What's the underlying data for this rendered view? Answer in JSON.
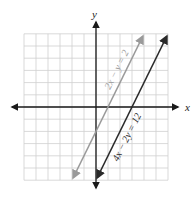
{
  "chart_data": {
    "type": "line",
    "title": "",
    "xlabel": "x",
    "ylabel": "y",
    "xlim": [
      -6,
      6
    ],
    "ylim": [
      -6,
      6
    ],
    "grid": true,
    "grid_step": 1,
    "series": [
      {
        "name": "2x − y = 2",
        "equation": "y = 2x - 2",
        "color": "#9a9a9a",
        "x": [
          -1.9,
          3.9
        ],
        "y": [
          -5.8,
          5.8
        ]
      },
      {
        "name": "4x − 2y = 12",
        "equation": "y = 2x - 6",
        "color": "#2a2a2a",
        "x": [
          0.1,
          5.9
        ],
        "y": [
          -5.8,
          5.8
        ]
      }
    ]
  },
  "labels": {
    "x_axis": "x",
    "y_axis": "y",
    "line1": "2x − y = 2",
    "line2": "4x − 2y = 12"
  },
  "colors": {
    "grid": "#cfcfcf",
    "axis": "#1a1a1a",
    "line1": "#9a9a9a",
    "line2": "#2a2a2a"
  }
}
